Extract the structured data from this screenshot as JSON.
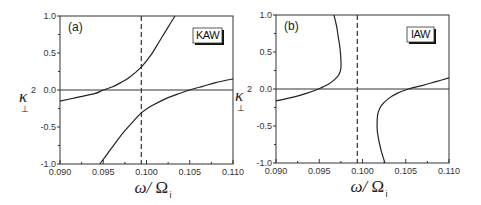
{
  "chart_data": [
    {
      "type": "line",
      "panel_label": "(a)",
      "badge": "KAW",
      "title": "",
      "xlabel": "ω/ Ω_i",
      "ylabel": "κ_⊥^2",
      "xlim": [
        0.09,
        0.11
      ],
      "ylim": [
        -1.0,
        1.0
      ],
      "x_ticks": [
        "0.090",
        "0.095",
        "0.100",
        "0.105",
        "0.110"
      ],
      "y_ticks": [
        "-1.0",
        "-0.5",
        "0.0",
        "0.5",
        "1.0"
      ],
      "grid": false,
      "reference_lines": {
        "horizontal_y": 0.0,
        "vertical_dashed_x": 0.0994
      },
      "series": [
        {
          "name": "upper branch",
          "points": [
            [
              0.09,
              -0.15
            ],
            [
              0.092,
              -0.1
            ],
            [
              0.094,
              -0.05
            ],
            [
              0.095,
              0.0
            ],
            [
              0.096,
              0.04
            ],
            [
              0.097,
              0.1
            ],
            [
              0.098,
              0.17
            ],
            [
              0.0994,
              0.31
            ],
            [
              0.1005,
              0.47
            ],
            [
              0.1015,
              0.66
            ],
            [
              0.1025,
              0.85
            ],
            [
              0.1033,
              1.0
            ]
          ]
        },
        {
          "name": "lower branch",
          "points": [
            [
              0.0946,
              -1.0
            ],
            [
              0.0955,
              -0.86
            ],
            [
              0.0965,
              -0.7
            ],
            [
              0.0975,
              -0.55
            ],
            [
              0.0985,
              -0.42
            ],
            [
              0.0994,
              -0.31
            ],
            [
              0.1005,
              -0.22
            ],
            [
              0.102,
              -0.13
            ],
            [
              0.1035,
              -0.06
            ],
            [
              0.105,
              0.0
            ],
            [
              0.1065,
              0.05
            ],
            [
              0.108,
              0.1
            ],
            [
              0.11,
              0.15
            ]
          ]
        }
      ]
    },
    {
      "type": "line",
      "panel_label": "(b)",
      "badge": "IAW",
      "title": "",
      "xlabel": "ω/ Ω_i",
      "ylabel": "κ_⊥^2",
      "xlim": [
        0.09,
        0.11
      ],
      "ylim": [
        -1.0,
        1.0
      ],
      "x_ticks": [
        "0.090",
        "0.095",
        "0.100",
        "0.105",
        "0.110"
      ],
      "y_ticks": [
        "-1.0",
        "-0.5",
        "0.0",
        "0.5",
        "1.0"
      ],
      "grid": false,
      "reference_lines": {
        "horizontal_y": 0.0,
        "vertical_dashed_x": 0.0994
      },
      "series": [
        {
          "name": "left branch",
          "points": [
            [
              0.09,
              -0.16
            ],
            [
              0.092,
              -0.11
            ],
            [
              0.0935,
              -0.06
            ],
            [
              0.0949,
              0.0
            ],
            [
              0.096,
              0.06
            ],
            [
              0.0968,
              0.13
            ],
            [
              0.0973,
              0.2
            ],
            [
              0.0975,
              0.28
            ],
            [
              0.0975,
              0.4
            ],
            [
              0.0974,
              0.55
            ],
            [
              0.0972,
              0.7
            ],
            [
              0.097,
              0.85
            ],
            [
              0.0967,
              1.0
            ]
          ]
        },
        {
          "name": "right branch",
          "points": [
            [
              0.1026,
              -1.0
            ],
            [
              0.1022,
              -0.85
            ],
            [
              0.1019,
              -0.7
            ],
            [
              0.1017,
              -0.55
            ],
            [
              0.1017,
              -0.42
            ],
            [
              0.1018,
              -0.32
            ],
            [
              0.1022,
              -0.22
            ],
            [
              0.103,
              -0.13
            ],
            [
              0.104,
              -0.06
            ],
            [
              0.1053,
              0.0
            ],
            [
              0.107,
              0.05
            ],
            [
              0.1085,
              0.1
            ],
            [
              0.11,
              0.15
            ]
          ]
        }
      ]
    }
  ],
  "layout": {
    "panels": [
      {
        "left": 60,
        "top": 16,
        "right": 233,
        "bottom": 164
      },
      {
        "left": 276,
        "top": 15,
        "right": 449,
        "bottom": 163
      }
    ],
    "badge_boxes": [
      {
        "x": 193,
        "y": 28,
        "w": 29,
        "h": 15
      },
      {
        "x": 407,
        "y": 27,
        "w": 27,
        "h": 15
      }
    ]
  }
}
